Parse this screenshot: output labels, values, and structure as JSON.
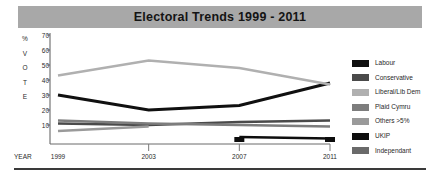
{
  "title": "Electoral Trends 1999 - 2011",
  "axes": {
    "y_axis_title_chars": [
      "%",
      "V",
      "O",
      "T",
      "E"
    ],
    "y_ticks": [
      70,
      60,
      50,
      40,
      30,
      20,
      10
    ],
    "x_axis_label": "YEAR",
    "x_ticks": [
      "1999",
      "2003",
      "2007",
      "2011"
    ]
  },
  "legend": {
    "items": [
      {
        "label": "Labour",
        "color": "#101010"
      },
      {
        "label": "Conservative",
        "color": "#4a4a4a"
      },
      {
        "label": "Liberal/Lib Dem",
        "color": "#b0b0b0"
      },
      {
        "label": "Plaid Cymru",
        "color": "#7d7d7d"
      },
      {
        "label": "Others >5%",
        "color": "#9a9a9a"
      },
      {
        "label": "UKIP",
        "color": "#0d0d0d"
      },
      {
        "label": "Independant",
        "color": "#6a6a6a"
      }
    ]
  },
  "chart_data": {
    "type": "line",
    "title": "Electoral Trends 1999 - 2011",
    "xlabel": "YEAR",
    "ylabel": "% VOTE",
    "x": [
      "1999",
      "2003",
      "2007",
      "2011"
    ],
    "ylim": [
      0,
      70
    ],
    "yticks": [
      10,
      20,
      30,
      40,
      50,
      60,
      70
    ],
    "grid": false,
    "legend_position": "right",
    "series": [
      {
        "name": "Labour",
        "color": "#101010",
        "values": [
          30,
          20,
          23,
          38
        ]
      },
      {
        "name": "Conservative",
        "color": "#4a4a4a",
        "values": [
          11,
          10,
          12,
          13
        ]
      },
      {
        "name": "Liberal/Lib Dem",
        "color": "#b0b0b0",
        "values": [
          43,
          53,
          48,
          37
        ]
      },
      {
        "name": "Plaid Cymru",
        "color": "#7d7d7d",
        "values": [
          13,
          11,
          10,
          9
        ]
      },
      {
        "name": "Others >5%",
        "color": "#9a9a9a",
        "values": [
          6,
          9,
          null,
          null
        ]
      },
      {
        "name": "UKIP",
        "color": "#0d0d0d",
        "values": [
          null,
          null,
          2,
          1
        ]
      },
      {
        "name": "Independant",
        "color": "#6a6a6a",
        "values": [
          null,
          null,
          null,
          null
        ]
      }
    ]
  }
}
